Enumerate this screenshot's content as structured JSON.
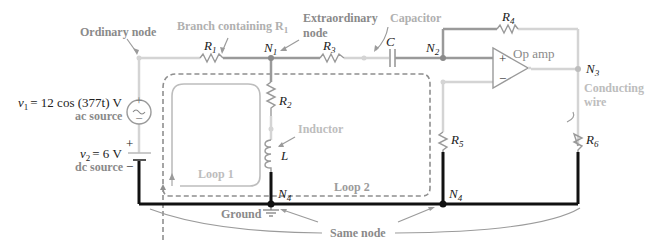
{
  "diagram": {
    "colors": {
      "wire_light": "#d4d4d4",
      "wire_mid": "#9a9a9a",
      "wire_dark": "#111111",
      "label_gray": "#9b9b9b",
      "label_dark": "#8a8a8a",
      "loop_dash": "#8f8f8f",
      "loop_solid": "#bdbdbd"
    },
    "labels": {
      "ordinary_node": "Ordinary node",
      "branch_containing": "Branch containing R",
      "branch_sub": "1",
      "extraordinary": "Extraordinary",
      "extraordinary_node": "node",
      "capacitor": "Capacitor",
      "op_amp": "Op amp",
      "conducting": "Conducting",
      "wire": "wire",
      "inductor": "Inductor",
      "loop1": "Loop 1",
      "loop2": "Loop 2",
      "ground": "Ground",
      "same_node": "Same node",
      "ac_source": "ac source",
      "dc_source": "dc source",
      "v1_eq": "= 12 cos (377t) V",
      "v2_eq": "= 6 V"
    },
    "components": {
      "R1": {
        "name": "R",
        "sub": "1"
      },
      "R2": {
        "name": "R",
        "sub": "2"
      },
      "R3": {
        "name": "R",
        "sub": "3"
      },
      "R4": {
        "name": "R",
        "sub": "4"
      },
      "R5": {
        "name": "R",
        "sub": "5"
      },
      "R6": {
        "name": "R",
        "sub": "6"
      },
      "C": {
        "name": "C"
      },
      "L": {
        "name": "L"
      },
      "v1": {
        "name": "v",
        "sub": "1"
      },
      "v2": {
        "name": "v",
        "sub": "2"
      }
    },
    "nodes": {
      "N1": {
        "name": "N",
        "sub": "1"
      },
      "N2": {
        "name": "N",
        "sub": "2"
      },
      "N3": {
        "name": "N",
        "sub": "3"
      },
      "N4a": {
        "name": "N",
        "sub": "4"
      },
      "N4b": {
        "name": "N",
        "sub": "4"
      }
    },
    "symbols": {
      "plus": "+",
      "minus": "−",
      "tilde": "~"
    }
  }
}
